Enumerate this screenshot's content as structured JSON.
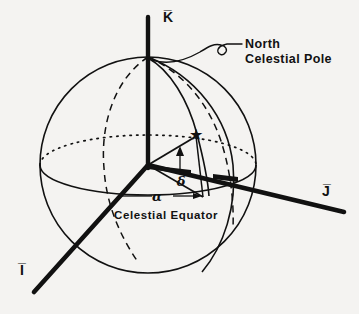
{
  "figure": {
    "background_color": "#f4f3f1",
    "ink_color": "#111111"
  },
  "axes": [
    {
      "id": "k",
      "label": "K̅",
      "name": "k-axis",
      "description": "vertical axis toward north celestial pole"
    },
    {
      "id": "j",
      "label": "J̅",
      "name": "j-axis",
      "description": "axis to the right in equatorial plane"
    },
    {
      "id": "i",
      "label": "I̅",
      "name": "i-axis",
      "description": "axis toward lower-left, vernal equinox direction"
    }
  ],
  "annotations": {
    "pole_line1": "North",
    "pole_line2": "Celestial Pole",
    "equator": "Celestial Equator",
    "right_ascension_symbol": "α",
    "declination_symbol": "δ"
  },
  "markers": {
    "star": "★",
    "star_name": "star-marker"
  },
  "geometry": {
    "sphere_center_x": 148,
    "sphere_center_y": 165,
    "sphere_radius": 108,
    "equator_ry": 30,
    "star_x": 196,
    "star_y": 134,
    "pole_x": 148,
    "pole_y": 62
  }
}
